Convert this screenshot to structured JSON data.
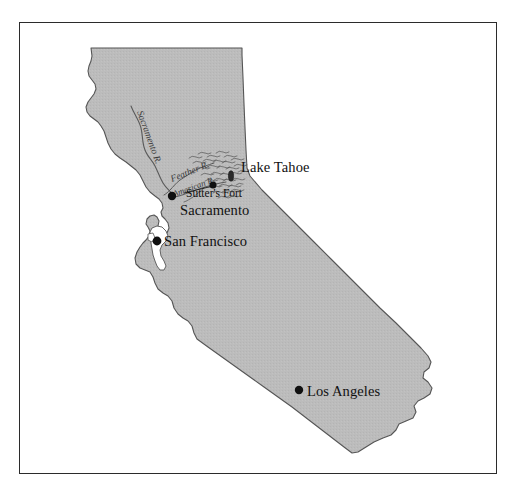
{
  "figure": {
    "type": "reference-map",
    "frame": {
      "border_color": "#2b2b2b"
    },
    "background_color": "#ffffff"
  },
  "map": {
    "state_name": "California",
    "land_fill_color": "#bcbcbc",
    "land_outline_color": "#555555",
    "water_fill_color": "#ffffff",
    "marker_color": "#101010",
    "cities": [
      {
        "name": "Lake Tahoe",
        "label": "Lake Tahoe",
        "marker": "lake-oval",
        "x": 231,
        "y": 176,
        "label_x": 241,
        "label_y": 172
      },
      {
        "name": "Sutter's Fort",
        "label": "Sutter's Fort",
        "marker": "dot",
        "x": 213,
        "y": 186,
        "label_x": 186,
        "label_y": 196
      },
      {
        "name": "Sacramento",
        "label": "Sacramento",
        "marker": "dot",
        "x": 172,
        "y": 196,
        "label_x": 181,
        "label_y": 215
      },
      {
        "name": "San Francisco",
        "label": "San Francisco",
        "marker": "dot",
        "x": 157,
        "y": 241,
        "label_x": 164,
        "label_y": 245
      },
      {
        "name": "Los Angeles",
        "label": "Los Angeles",
        "marker": "dot",
        "x": 299,
        "y": 390,
        "label_x": 307,
        "label_y": 395
      }
    ],
    "rivers": [
      {
        "name": "Sacramento River",
        "label": "Sacramento R."
      },
      {
        "name": "Feather River",
        "label": "Feather R."
      },
      {
        "name": "American River",
        "label": "American R."
      }
    ],
    "terrain": {
      "name": "Sierra Nevada foothills hachures",
      "style": "hill-hachure"
    }
  }
}
